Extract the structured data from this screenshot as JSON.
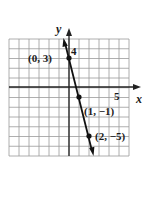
{
  "chart_data": {
    "type": "line",
    "title": "",
    "xlabel": "x",
    "ylabel": "y",
    "xlim": [
      -6,
      6
    ],
    "ylim": [
      -7,
      5
    ],
    "grid": true,
    "tick_labels": {
      "x": [
        "5"
      ],
      "y": [
        "4"
      ]
    },
    "series": [
      {
        "name": "line",
        "equation": "y = -4x + 3",
        "x": [
          0,
          1,
          2
        ],
        "y": [
          3,
          -1,
          -5
        ]
      }
    ],
    "annotations": [
      {
        "text": "(0, 3)",
        "x": 0,
        "y": 3
      },
      {
        "text": "(1, −1)",
        "x": 1,
        "y": -1
      },
      {
        "text": "(2, −5)",
        "x": 2,
        "y": -5
      }
    ]
  },
  "labels": {
    "x_axis": "x",
    "y_axis": "y",
    "x_tick": "5",
    "y_tick": "4",
    "p1": "(0, 3)",
    "p2": "(1, −1)",
    "p3": "(2, −5)"
  }
}
